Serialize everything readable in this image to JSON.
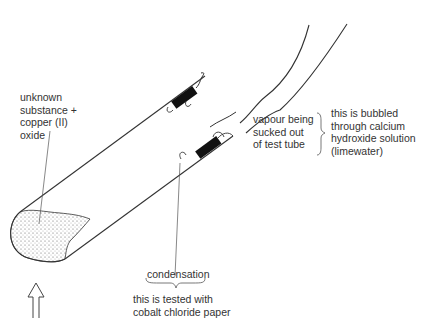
{
  "diagram": {
    "labels": {
      "substance": [
        "unknown",
        "substance +",
        "copper (II)",
        "oxide"
      ],
      "vapour": [
        "vapour being",
        "sucked out",
        "of test tube"
      ],
      "bubbled": [
        "this is bubbled",
        "through calcium",
        "hydroxide solution",
        "(limewater)"
      ],
      "condensation": "condensation",
      "tested": [
        "this is tested with",
        "cobalt chloride paper"
      ]
    },
    "elements": [
      "test-tube",
      "powder-sample",
      "rubber-stopper",
      "delivery-tube",
      "heat-arrow",
      "condensation-droplets"
    ]
  }
}
